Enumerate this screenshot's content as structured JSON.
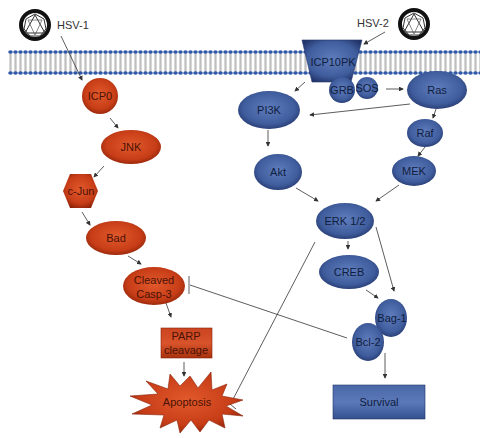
{
  "colors": {
    "red_fill": "#c73d17",
    "red_edge": "#8a2208",
    "red_light": "#e2592c",
    "blue_fill": "#3f5c9c",
    "blue_edge": "#22356a",
    "blue_light": "#5f7dbd",
    "membrane_head": "#2f58a8",
    "membrane_tail": "#9a9a9a",
    "arrow": "#333333"
  },
  "viruses": [
    {
      "id": "hsv1",
      "label": "HSV-1"
    },
    {
      "id": "hsv2",
      "label": "HSV-2"
    }
  ],
  "nodes": {
    "icp0": "ICP0",
    "jnk": "JNK",
    "cjun": "c-Jun",
    "bad": "Bad",
    "casp3_line1": "Cleaved",
    "casp3_line2": "Casp-3",
    "parp_line1": "PARP",
    "parp_line2": "cleavage",
    "apoptosis": "Apoptosis",
    "icp10pk": "ICP10PK",
    "grb": "GRB",
    "sos": "SOS",
    "ras": "Ras",
    "pi3k": "PI3K",
    "raf": "Raf",
    "akt": "Akt",
    "mek": "MEK",
    "erk": "ERK 1/2",
    "creb": "CREB",
    "bag1": "Bag-1",
    "bcl2": "Bcl-2",
    "survival": "Survival"
  },
  "edges": [
    {
      "from": "HSV-1",
      "to": "ICP0",
      "type": "activation"
    },
    {
      "from": "ICP0",
      "to": "JNK",
      "type": "activation"
    },
    {
      "from": "JNK",
      "to": "c-Jun",
      "type": "activation"
    },
    {
      "from": "c-Jun",
      "to": "Bad",
      "type": "activation"
    },
    {
      "from": "Bad",
      "to": "Cleaved Casp-3",
      "type": "activation"
    },
    {
      "from": "Cleaved Casp-3",
      "to": "PARP cleavage",
      "type": "activation"
    },
    {
      "from": "PARP cleavage",
      "to": "Apoptosis",
      "type": "activation"
    },
    {
      "from": "HSV-2",
      "to": "ICP10PK",
      "type": "activation"
    },
    {
      "from": "ICP10PK",
      "to": "PI3K",
      "type": "activation"
    },
    {
      "from": "SOS",
      "to": "Ras",
      "type": "activation"
    },
    {
      "from": "Ras",
      "to": "PI3K",
      "type": "activation"
    },
    {
      "from": "Ras",
      "to": "Raf",
      "type": "activation"
    },
    {
      "from": "Raf",
      "to": "MEK",
      "type": "activation"
    },
    {
      "from": "PI3K",
      "to": "Akt",
      "type": "activation"
    },
    {
      "from": "Akt",
      "to": "ERK 1/2",
      "type": "activation"
    },
    {
      "from": "MEK",
      "to": "ERK 1/2",
      "type": "activation"
    },
    {
      "from": "ERK 1/2",
      "to": "CREB",
      "type": "activation"
    },
    {
      "from": "ERK 1/2",
      "to": "Bag-1",
      "type": "activation"
    },
    {
      "from": "CREB",
      "to": "Bag-1",
      "type": "activation"
    },
    {
      "from": "ERK 1/2",
      "to": "Apoptosis",
      "type": "inhibition"
    },
    {
      "from": "Bcl-2",
      "to": "Cleaved Casp-3",
      "type": "inhibition"
    },
    {
      "from": "Bcl-2",
      "to": "Survival",
      "type": "activation"
    }
  ]
}
